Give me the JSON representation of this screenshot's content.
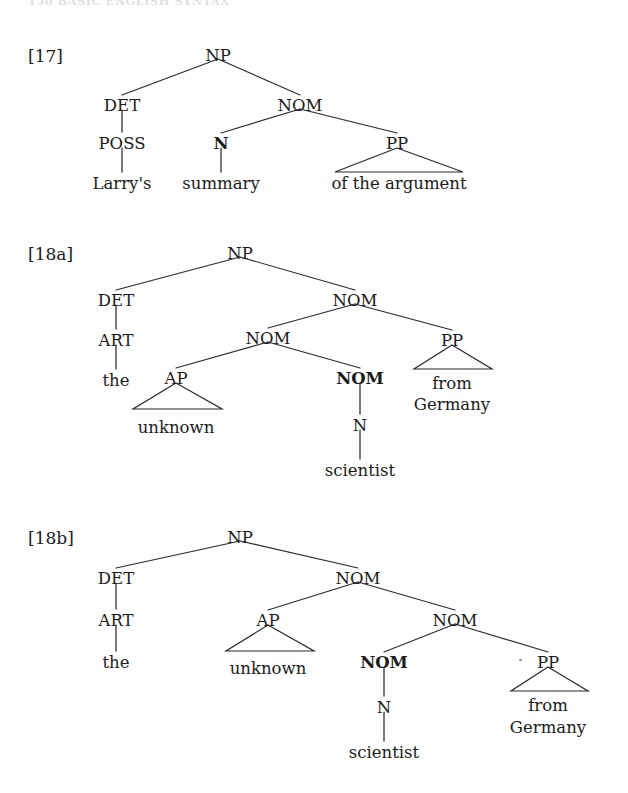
{
  "page": {
    "width": 628,
    "height": 793,
    "background": "#fefefe",
    "ink_color": "#1b1b1b",
    "line_color": "#2a2a30",
    "running_header": "150    BASIC ENGLISH SYNTAX"
  },
  "examples": [
    {
      "id": "ex-17",
      "label": "[17]",
      "phrase": "Larry's summary of the argument",
      "tree": {
        "type": "constituency-tree",
        "nodes": [
          {
            "id": "np",
            "text": "NP",
            "x": 218,
            "y": 55,
            "bold": false,
            "kind": "category"
          },
          {
            "id": "det",
            "text": "DET",
            "x": 122,
            "y": 105,
            "bold": false,
            "kind": "category"
          },
          {
            "id": "nom",
            "text": "NOM",
            "x": 300,
            "y": 105,
            "bold": false,
            "kind": "category"
          },
          {
            "id": "poss",
            "text": "POSS",
            "x": 122,
            "y": 143,
            "bold": false,
            "kind": "category"
          },
          {
            "id": "n",
            "text": "N",
            "x": 221,
            "y": 143,
            "bold": true,
            "kind": "category"
          },
          {
            "id": "pp",
            "text": "PP",
            "x": 397,
            "y": 143,
            "bold": false,
            "kind": "category"
          },
          {
            "id": "larrys",
            "text": "Larry's",
            "x": 122,
            "y": 183,
            "bold": false,
            "kind": "leaf"
          },
          {
            "id": "summary",
            "text": "summary",
            "x": 221,
            "y": 183,
            "bold": false,
            "kind": "leaf"
          },
          {
            "id": "ofthe",
            "text": "of the argument",
            "x": 399,
            "y": 183,
            "bold": false,
            "kind": "leaf"
          }
        ],
        "branches": [
          {
            "from": "np",
            "to": "det"
          },
          {
            "from": "np",
            "to": "nom"
          },
          {
            "from": "nom",
            "to": "n"
          },
          {
            "from": "nom",
            "to": "pp"
          }
        ],
        "stems": [
          {
            "from": "det",
            "to": "poss"
          },
          {
            "from": "poss",
            "to": "larrys"
          },
          {
            "from": "n",
            "to": "summary"
          }
        ],
        "triangles": [
          {
            "apex": "pp",
            "left": 335,
            "right": 463,
            "base_y": 172
          }
        ]
      }
    },
    {
      "id": "ex-18a",
      "label": "[18a]",
      "phrase": "the unknown scientist from Germany",
      "tree": {
        "type": "constituency-tree",
        "nodes": [
          {
            "id": "np",
            "text": "NP",
            "x": 240,
            "y": 253,
            "bold": false,
            "kind": "category"
          },
          {
            "id": "det",
            "text": "DET",
            "x": 116,
            "y": 300,
            "bold": false,
            "kind": "category"
          },
          {
            "id": "nom1",
            "text": "NOM",
            "x": 355,
            "y": 300,
            "bold": false,
            "kind": "category"
          },
          {
            "id": "art",
            "text": "ART",
            "x": 116,
            "y": 340,
            "bold": false,
            "kind": "category"
          },
          {
            "id": "nom2",
            "text": "NOM",
            "x": 268,
            "y": 338,
            "bold": false,
            "kind": "category"
          },
          {
            "id": "pp",
            "text": "PP",
            "x": 452,
            "y": 340,
            "bold": false,
            "kind": "category"
          },
          {
            "id": "the",
            "text": "the",
            "x": 116,
            "y": 380,
            "bold": false,
            "kind": "leaf"
          },
          {
            "id": "ap",
            "text": "AP",
            "x": 176,
            "y": 378,
            "bold": false,
            "kind": "category"
          },
          {
            "id": "nom3",
            "text": "NOM",
            "x": 360,
            "y": 378,
            "bold": true,
            "kind": "category"
          },
          {
            "id": "from",
            "text": "from",
            "x": 452,
            "y": 383,
            "bold": false,
            "kind": "leaf"
          },
          {
            "id": "germany",
            "text": "Germany",
            "x": 452,
            "y": 404,
            "bold": false,
            "kind": "leaf"
          },
          {
            "id": "unknown",
            "text": "unknown",
            "x": 176,
            "y": 427,
            "bold": false,
            "kind": "leaf"
          },
          {
            "id": "n",
            "text": "N",
            "x": 360,
            "y": 425,
            "bold": false,
            "kind": "category"
          },
          {
            "id": "scientist",
            "text": "scientist",
            "x": 360,
            "y": 470,
            "bold": false,
            "kind": "leaf"
          }
        ],
        "branches": [
          {
            "from": "np",
            "to": "det"
          },
          {
            "from": "np",
            "to": "nom1"
          },
          {
            "from": "nom1",
            "to": "nom2"
          },
          {
            "from": "nom1",
            "to": "pp"
          },
          {
            "from": "nom2",
            "to": "ap"
          },
          {
            "from": "nom2",
            "to": "nom3"
          }
        ],
        "stems": [
          {
            "from": "det",
            "to": "art"
          },
          {
            "from": "art",
            "to": "the"
          },
          {
            "from": "nom3",
            "to": "n"
          },
          {
            "from": "n",
            "to": "scientist"
          }
        ],
        "triangles": [
          {
            "apex": "ap",
            "left": 133,
            "right": 222,
            "base_y": 409
          },
          {
            "apex": "pp",
            "left": 414,
            "right": 492,
            "base_y": 369
          }
        ]
      }
    },
    {
      "id": "ex-18b",
      "label": "[18b]",
      "phrase": "the unknown scientist from Germany",
      "tree": {
        "type": "constituency-tree",
        "nodes": [
          {
            "id": "np",
            "text": "NP",
            "x": 240,
            "y": 537,
            "bold": false,
            "kind": "category"
          },
          {
            "id": "det",
            "text": "DET",
            "x": 116,
            "y": 578,
            "bold": false,
            "kind": "category"
          },
          {
            "id": "nom1",
            "text": "NOM",
            "x": 358,
            "y": 578,
            "bold": false,
            "kind": "category"
          },
          {
            "id": "art",
            "text": "ART",
            "x": 116,
            "y": 620,
            "bold": false,
            "kind": "category"
          },
          {
            "id": "ap",
            "text": "AP",
            "x": 268,
            "y": 620,
            "bold": false,
            "kind": "category"
          },
          {
            "id": "nom2",
            "text": "NOM",
            "x": 455,
            "y": 620,
            "bold": false,
            "kind": "category"
          },
          {
            "id": "the",
            "text": "the",
            "x": 116,
            "y": 662,
            "bold": false,
            "kind": "leaf"
          },
          {
            "id": "unknown",
            "text": "unknown",
            "x": 268,
            "y": 668,
            "bold": false,
            "kind": "leaf"
          },
          {
            "id": "nom3",
            "text": "NOM",
            "x": 384,
            "y": 662,
            "bold": true,
            "kind": "category"
          },
          {
            "id": "pp",
            "text": "PP",
            "x": 548,
            "y": 662,
            "bold": false,
            "kind": "category"
          },
          {
            "id": "n",
            "text": "N",
            "x": 384,
            "y": 707,
            "bold": false,
            "kind": "category"
          },
          {
            "id": "from",
            "text": "from",
            "x": 548,
            "y": 705,
            "bold": false,
            "kind": "leaf"
          },
          {
            "id": "germany",
            "text": "Germany",
            "x": 548,
            "y": 727,
            "bold": false,
            "kind": "leaf"
          },
          {
            "id": "scientist",
            "text": "scientist",
            "x": 384,
            "y": 752,
            "bold": false,
            "kind": "leaf"
          }
        ],
        "branches": [
          {
            "from": "np",
            "to": "det"
          },
          {
            "from": "np",
            "to": "nom1"
          },
          {
            "from": "nom1",
            "to": "ap"
          },
          {
            "from": "nom1",
            "to": "nom2"
          },
          {
            "from": "nom2",
            "to": "nom3"
          },
          {
            "from": "nom2",
            "to": "pp"
          }
        ],
        "stems": [
          {
            "from": "det",
            "to": "art"
          },
          {
            "from": "art",
            "to": "the"
          },
          {
            "from": "nom3",
            "to": "n"
          },
          {
            "from": "n",
            "to": "scientist"
          }
        ],
        "triangles": [
          {
            "apex": "ap",
            "left": 226,
            "right": 314,
            "base_y": 651
          },
          {
            "apex": "pp",
            "left": 511,
            "right": 588,
            "base_y": 691
          }
        ]
      }
    }
  ],
  "specks": [
    {
      "x": 519,
      "y": 659,
      "size": 3
    }
  ]
}
